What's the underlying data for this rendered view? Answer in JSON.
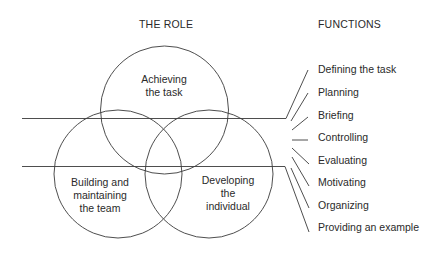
{
  "headings": {
    "role": "THE ROLE",
    "functions": "FUNCTIONS"
  },
  "circles": [
    {
      "label_lines": [
        "Achieving",
        "the task"
      ]
    },
    {
      "label_lines": [
        "Building and",
        "maintaining",
        "the team"
      ]
    },
    {
      "label_lines": [
        "Developing",
        "the",
        "individual"
      ]
    }
  ],
  "functions": [
    "Defining the task",
    "Planning",
    "Briefing",
    "Controlling",
    "Evaluating",
    "Motivating",
    "Organizing",
    "Providing an example"
  ],
  "colors": {
    "line": "#3a3a3a",
    "text": "#2a2a2a",
    "background": "#ffffff"
  }
}
